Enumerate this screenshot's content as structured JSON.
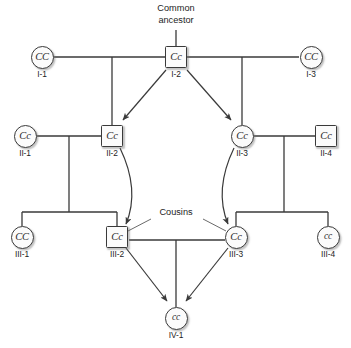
{
  "diagram": {
    "annotations": {
      "common_ancestor_line1": "Common",
      "common_ancestor_line2": "ancestor",
      "cousins": "Cousins"
    },
    "colors": {
      "line": "#3a3a3a",
      "symbol_fill": "#fbfbfb",
      "text": "#1d1d1d",
      "background": "#ffffff"
    },
    "individuals": [
      {
        "id": "I-1",
        "shape": "circle",
        "genotype": "CC",
        "sex": "female",
        "x": 42,
        "y": 57
      },
      {
        "id": "I-2",
        "shape": "square",
        "genotype": "Cc",
        "sex": "male",
        "x": 176,
        "y": 57
      },
      {
        "id": "I-3",
        "shape": "circle",
        "genotype": "CC",
        "sex": "female",
        "x": 311,
        "y": 57
      },
      {
        "id": "II-1",
        "shape": "circle",
        "genotype": "Cc",
        "sex": "female",
        "x": 25,
        "y": 136
      },
      {
        "id": "II-2",
        "shape": "square",
        "genotype": "Cc",
        "sex": "male",
        "x": 112,
        "y": 136
      },
      {
        "id": "II-3",
        "shape": "circle",
        "genotype": "Cc",
        "sex": "female",
        "x": 242,
        "y": 136
      },
      {
        "id": "II-4",
        "shape": "square",
        "genotype": "Cc",
        "sex": "male",
        "x": 326,
        "y": 136
      },
      {
        "id": "III-1",
        "shape": "circle",
        "genotype": "CC",
        "sex": "female",
        "x": 22,
        "y": 237
      },
      {
        "id": "III-2",
        "shape": "square",
        "genotype": "Cc",
        "sex": "male",
        "x": 117,
        "y": 237
      },
      {
        "id": "III-3",
        "shape": "circle",
        "genotype": "Cc",
        "sex": "female",
        "x": 236,
        "y": 237
      },
      {
        "id": "III-4",
        "shape": "circle",
        "genotype": "cc",
        "sex": "female",
        "x": 328,
        "y": 237
      },
      {
        "id": "IV-1",
        "shape": "circle",
        "genotype": "cc",
        "sex": "female",
        "x": 176,
        "y": 318
      }
    ]
  }
}
